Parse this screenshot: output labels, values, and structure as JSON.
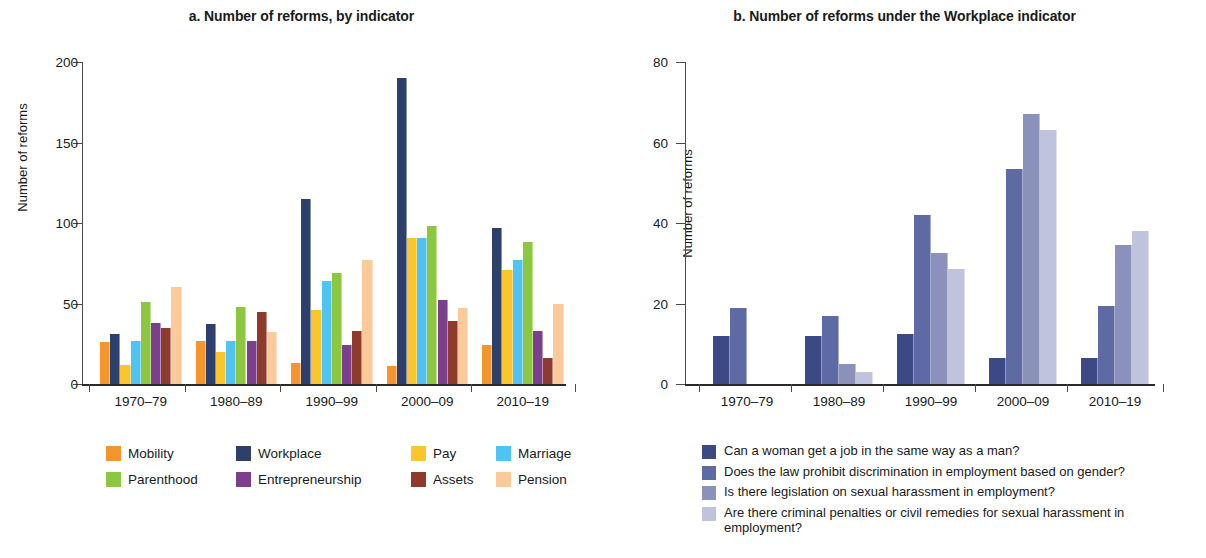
{
  "panel_a": {
    "title": "a. Number of reforms, by indicator",
    "ylabel": "Number of reforms",
    "yticks": [
      "0",
      "50",
      "100",
      "150",
      "200"
    ],
    "legend": [
      {
        "label": "Mobility",
        "color": "#F4952E"
      },
      {
        "label": "Workplace",
        "color": "#2D3F6C"
      },
      {
        "label": "Pay",
        "color": "#FBC52D"
      },
      {
        "label": "Marriage",
        "color": "#4FC3F2"
      },
      {
        "label": "Parenthood",
        "color": "#8DC63F"
      },
      {
        "label": "Entrepreneurship",
        "color": "#7B3F8C"
      },
      {
        "label": "Assets",
        "color": "#8E3B2E"
      },
      {
        "label": "Pension",
        "color": "#FBC99A"
      }
    ]
  },
  "panel_b": {
    "title": "b. Number of reforms under the Workplace indicator",
    "ylabel": "Number of reforms",
    "yticks": [
      "0",
      "20",
      "40",
      "60",
      "80"
    ],
    "legend": [
      {
        "label": "Can a woman get a job in the same way as a man?",
        "color": "#3B4A85"
      },
      {
        "label": "Does the law prohibit discrimination in employment based on gender?",
        "color": "#5D6AA3"
      },
      {
        "label": "Is there legislation on sexual harassment in employment?",
        "color": "#8A92BC"
      },
      {
        "label": "Are there criminal penalties or civil remedies for sexual harassment in employment?",
        "color": "#BFC3DB"
      }
    ]
  },
  "chart_data": [
    {
      "type": "bar",
      "title": "a. Number of reforms, by indicator",
      "xlabel": "",
      "ylabel": "Number of reforms",
      "ylim": [
        0,
        200
      ],
      "yticks": [
        0,
        50,
        100,
        150,
        200
      ],
      "grid": false,
      "legend_position": "bottom",
      "categories": [
        "1970–79",
        "1980–89",
        "1990–99",
        "2000–09",
        "2010–19"
      ],
      "series": [
        {
          "name": "Mobility",
          "color": "#F4952E",
          "values": [
            26,
            27,
            13,
            11,
            24
          ]
        },
        {
          "name": "Workplace",
          "color": "#2D3F6C",
          "values": [
            31,
            37,
            115,
            190,
            97
          ]
        },
        {
          "name": "Pay",
          "color": "#FBC52D",
          "values": [
            12,
            20,
            46,
            91,
            71
          ]
        },
        {
          "name": "Marriage",
          "color": "#4FC3F2",
          "values": [
            27,
            27,
            64,
            91,
            77
          ]
        },
        {
          "name": "Parenthood",
          "color": "#8DC63F",
          "values": [
            51,
            48,
            69,
            98,
            88
          ]
        },
        {
          "name": "Entrepreneurship",
          "color": "#7B3F8C",
          "values": [
            38,
            27,
            24,
            52,
            33
          ]
        },
        {
          "name": "Assets",
          "color": "#8E3B2E",
          "values": [
            35,
            45,
            33,
            39,
            16
          ]
        },
        {
          "name": "Pension",
          "color": "#FBC99A",
          "values": [
            60,
            32,
            77,
            47,
            50
          ]
        }
      ]
    },
    {
      "type": "bar",
      "title": "b. Number of reforms under the Workplace indicator",
      "xlabel": "",
      "ylabel": "Number of reforms",
      "ylim": [
        0,
        80
      ],
      "yticks": [
        0,
        20,
        40,
        60,
        80
      ],
      "grid": false,
      "legend_position": "bottom",
      "categories": [
        "1970–79",
        "1980–89",
        "1990–99",
        "2000–09",
        "2010–19"
      ],
      "series": [
        {
          "name": "Can a woman get a job in the same way as a man?",
          "color": "#3B4A85",
          "values": [
            12,
            12,
            12.5,
            6.5,
            6.5
          ]
        },
        {
          "name": "Does the law prohibit discrimination in employment based on gender?",
          "color": "#5D6AA3",
          "values": [
            19,
            17,
            42,
            53.5,
            19.5
          ]
        },
        {
          "name": "Is there legislation on sexual harassment in employment?",
          "color": "#8A92BC",
          "values": [
            0,
            5,
            32.5,
            67,
            34.5
          ]
        },
        {
          "name": "Are there criminal penalties or civil remedies for sexual harassment in employment?",
          "color": "#BFC3DB",
          "values": [
            0,
            3,
            28.5,
            63,
            38
          ]
        }
      ]
    }
  ]
}
